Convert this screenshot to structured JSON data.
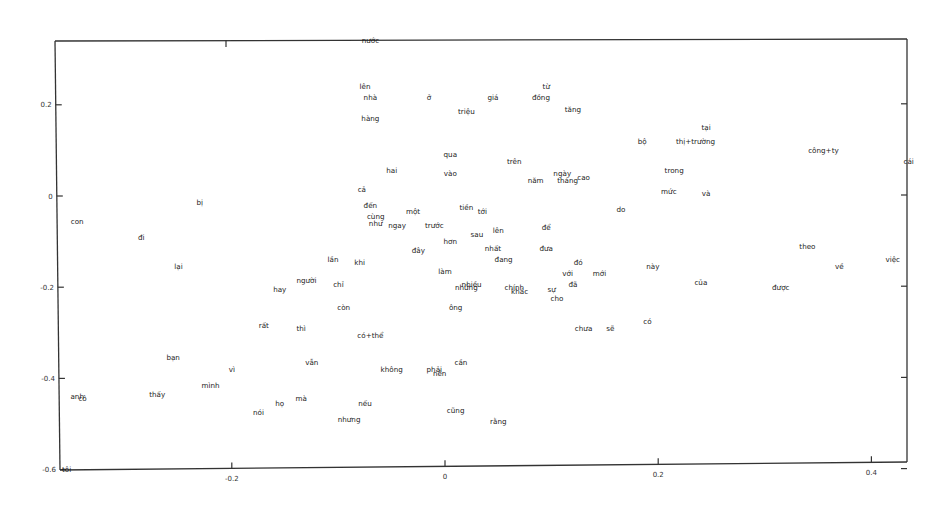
{
  "chart_data": {
    "type": "scatter",
    "title": "",
    "xlabel": "",
    "ylabel": "",
    "xlim": [
      -0.36,
      0.43
    ],
    "ylim": [
      -0.6,
      0.34
    ],
    "grid": false,
    "legend": null,
    "x_ticks": [
      -0.2,
      0,
      0.2,
      0.4
    ],
    "x_tick_labels": [
      "-0.2",
      "0",
      "0.2",
      "0.4"
    ],
    "y_ticks": [
      0.2,
      0,
      -0.2,
      -0.4,
      -0.6
    ],
    "y_tick_labels": [
      "0.2",
      "0",
      "-0.2",
      "-0.4",
      "-0.6"
    ],
    "points": [
      {
        "label": "nước",
        "x": -0.07,
        "y": 0.34
      },
      {
        "label": "lên",
        "x": -0.075,
        "y": 0.24
      },
      {
        "label": "nhà",
        "x": -0.07,
        "y": 0.215
      },
      {
        "label": "ở",
        "x": -0.015,
        "y": 0.215
      },
      {
        "label": "giá",
        "x": 0.045,
        "y": 0.215
      },
      {
        "label": "từ",
        "x": 0.095,
        "y": 0.24
      },
      {
        "label": "đồng",
        "x": 0.09,
        "y": 0.215
      },
      {
        "label": "tăng",
        "x": 0.12,
        "y": 0.19
      },
      {
        "label": "triệu",
        "x": 0.02,
        "y": 0.185
      },
      {
        "label": "hàng",
        "x": -0.07,
        "y": 0.17
      },
      {
        "label": "tại",
        "x": 0.245,
        "y": 0.15
      },
      {
        "label": "bộ",
        "x": 0.185,
        "y": 0.12
      },
      {
        "label": "thị+trường",
        "x": 0.235,
        "y": 0.12
      },
      {
        "label": "công+ty",
        "x": 0.355,
        "y": 0.1
      },
      {
        "label": "cái",
        "x": 0.435,
        "y": 0.075
      },
      {
        "label": "qua",
        "x": 0.005,
        "y": 0.09
      },
      {
        "label": "trên",
        "x": 0.065,
        "y": 0.075
      },
      {
        "label": "trong",
        "x": 0.215,
        "y": 0.055
      },
      {
        "label": "hai",
        "x": -0.05,
        "y": 0.055
      },
      {
        "label": "vào",
        "x": 0.005,
        "y": 0.05
      },
      {
        "label": "ngày",
        "x": 0.11,
        "y": 0.05
      },
      {
        "label": "năm",
        "x": 0.085,
        "y": 0.035
      },
      {
        "label": "tháng",
        "x": 0.115,
        "y": 0.035
      },
      {
        "label": "cao",
        "x": 0.13,
        "y": 0.04
      },
      {
        "label": "mức",
        "x": 0.21,
        "y": 0.01
      },
      {
        "label": "và",
        "x": 0.245,
        "y": 0.005
      },
      {
        "label": "cả",
        "x": -0.078,
        "y": 0.015
      },
      {
        "label": "bị",
        "x": -0.23,
        "y": -0.015
      },
      {
        "label": "đến",
        "x": -0.07,
        "y": -0.02
      },
      {
        "label": "một",
        "x": -0.03,
        "y": -0.035
      },
      {
        "label": "tiền",
        "x": 0.02,
        "y": -0.025
      },
      {
        "label": "tới",
        "x": 0.035,
        "y": -0.035
      },
      {
        "label": "do",
        "x": 0.165,
        "y": -0.03
      },
      {
        "label": "cùng",
        "x": -0.065,
        "y": -0.045
      },
      {
        "label": "như",
        "x": -0.065,
        "y": -0.06
      },
      {
        "label": "ngay",
        "x": -0.045,
        "y": -0.065
      },
      {
        "label": "trước",
        "x": -0.01,
        "y": -0.065
      },
      {
        "label": "con",
        "x": -0.345,
        "y": -0.055
      },
      {
        "label": "để",
        "x": 0.095,
        "y": -0.07
      },
      {
        "label": "sau",
        "x": 0.03,
        "y": -0.085
      },
      {
        "label": "lên",
        "x": 0.05,
        "y": -0.075
      },
      {
        "label": "đi",
        "x": -0.285,
        "y": -0.09
      },
      {
        "label": "hơn",
        "x": 0.005,
        "y": -0.1
      },
      {
        "label": "theo",
        "x": 0.34,
        "y": -0.11
      },
      {
        "label": "đây",
        "x": -0.025,
        "y": -0.12
      },
      {
        "label": "nhất",
        "x": 0.045,
        "y": -0.115
      },
      {
        "label": "đưa",
        "x": 0.095,
        "y": -0.115
      },
      {
        "label": "việc",
        "x": 0.42,
        "y": -0.14
      },
      {
        "label": "lần",
        "x": -0.105,
        "y": -0.14
      },
      {
        "label": "khi",
        "x": -0.08,
        "y": -0.145
      },
      {
        "label": "đang",
        "x": 0.055,
        "y": -0.14
      },
      {
        "label": "đó",
        "x": 0.125,
        "y": -0.145
      },
      {
        "label": "về",
        "x": 0.37,
        "y": -0.155
      },
      {
        "label": "lại",
        "x": -0.25,
        "y": -0.155
      },
      {
        "label": "này",
        "x": 0.195,
        "y": -0.155
      },
      {
        "label": "làm",
        "x": 0.0,
        "y": -0.165
      },
      {
        "label": "với",
        "x": 0.115,
        "y": -0.17
      },
      {
        "label": "mới",
        "x": 0.145,
        "y": -0.17
      },
      {
        "label": "người",
        "x": -0.13,
        "y": -0.185
      },
      {
        "label": "chỉ",
        "x": -0.1,
        "y": -0.195
      },
      {
        "label": "của",
        "x": 0.24,
        "y": -0.19
      },
      {
        "label": "đã",
        "x": 0.12,
        "y": -0.195
      },
      {
        "label": "nhiều",
        "x": 0.025,
        "y": -0.195
      },
      {
        "label": "những",
        "x": 0.02,
        "y": -0.2
      },
      {
        "label": "chính",
        "x": 0.065,
        "y": -0.2
      },
      {
        "label": "khác",
        "x": 0.07,
        "y": -0.21
      },
      {
        "label": "được",
        "x": 0.315,
        "y": -0.2
      },
      {
        "label": "hay",
        "x": -0.155,
        "y": -0.205
      },
      {
        "label": "sự",
        "x": 0.1,
        "y": -0.205
      },
      {
        "label": "cho",
        "x": 0.105,
        "y": -0.225
      },
      {
        "label": "còn",
        "x": -0.095,
        "y": -0.245
      },
      {
        "label": "ông",
        "x": 0.01,
        "y": -0.245
      },
      {
        "label": "có",
        "x": 0.19,
        "y": -0.275
      },
      {
        "label": "rất",
        "x": -0.17,
        "y": -0.285
      },
      {
        "label": "thì",
        "x": -0.135,
        "y": -0.29
      },
      {
        "label": "chưa",
        "x": 0.13,
        "y": -0.29
      },
      {
        "label": "sẽ",
        "x": 0.155,
        "y": -0.29
      },
      {
        "label": "có+thể",
        "x": -0.07,
        "y": -0.305
      },
      {
        "label": "bạn",
        "x": -0.255,
        "y": -0.355
      },
      {
        "label": "cần",
        "x": 0.015,
        "y": -0.365
      },
      {
        "label": "vẫn",
        "x": -0.125,
        "y": -0.365
      },
      {
        "label": "vì",
        "x": -0.2,
        "y": -0.38
      },
      {
        "label": "không",
        "x": -0.05,
        "y": -0.38
      },
      {
        "label": "phải",
        "x": -0.01,
        "y": -0.38
      },
      {
        "label": "nên",
        "x": -0.005,
        "y": -0.39
      },
      {
        "label": "mình",
        "x": -0.22,
        "y": -0.415
      },
      {
        "label": "anh",
        "x": -0.345,
        "y": -0.44
      },
      {
        "label": "cô",
        "x": -0.34,
        "y": -0.445
      },
      {
        "label": "thấy",
        "x": -0.27,
        "y": -0.435
      },
      {
        "label": "mà",
        "x": -0.135,
        "y": -0.445
      },
      {
        "label": "họ",
        "x": -0.155,
        "y": -0.455
      },
      {
        "label": "nếu",
        "x": -0.075,
        "y": -0.455
      },
      {
        "label": "nói",
        "x": -0.175,
        "y": -0.475
      },
      {
        "label": "cũng",
        "x": 0.01,
        "y": -0.47
      },
      {
        "label": "nhưng",
        "x": -0.09,
        "y": -0.49
      },
      {
        "label": "rằng",
        "x": 0.05,
        "y": -0.495
      },
      {
        "label": "tôi",
        "x": -0.355,
        "y": -0.6
      }
    ]
  }
}
